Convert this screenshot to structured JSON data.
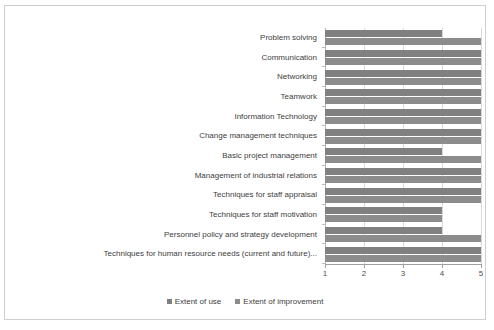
{
  "chart_data": {
    "type": "bar",
    "orientation": "horizontal",
    "title": "",
    "subtitle": "",
    "xlabel": "",
    "ylabel": "",
    "xlim": [
      1,
      5
    ],
    "xticks": [
      "1",
      "2",
      "3",
      "4",
      "5"
    ],
    "grid": true,
    "legend_position": "bottom",
    "categories": [
      "Problem solving",
      "Communication",
      "Networking",
      "Teamwork",
      "Information Technology",
      "Change management techniques",
      "Basic project management",
      "Management of industrial relations",
      "Techniques for staff appraisal",
      "Techniques for staff motivation",
      "Personnel policy and strategy development",
      "Techniques for human resource needs (current and future)..."
    ],
    "series": [
      {
        "name": "Extent of use",
        "color": "#808080",
        "values": [
          4,
          5,
          5,
          5,
          5,
          5,
          4,
          5,
          5,
          4,
          4,
          5
        ]
      },
      {
        "name": "Extent of improvement",
        "color": "#8c8c8c",
        "values": [
          5,
          5,
          5,
          5,
          5,
          5,
          5,
          5,
          5,
          4,
          5,
          5
        ]
      }
    ]
  },
  "legend": {
    "items": [
      {
        "label": "Extent of use",
        "color": "#808080"
      },
      {
        "label": "Extent of improvement",
        "color": "#8c8c8c"
      }
    ]
  },
  "frame": {
    "border_color": "#cfcfcf",
    "background": "#ffffff"
  }
}
